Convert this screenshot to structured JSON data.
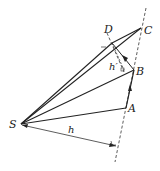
{
  "diagram": {
    "points": {
      "S": {
        "label": "S",
        "x": 21,
        "y": 124
      },
      "A": {
        "label": "A",
        "x": 126,
        "y": 108
      },
      "B": {
        "label": "B",
        "x": 134,
        "y": 70
      },
      "C": {
        "label": "C",
        "x": 141,
        "y": 28
      },
      "D": {
        "label": "D",
        "x": 107,
        "y": 30
      }
    },
    "distances": {
      "h": "h",
      "h_prime": "h′"
    },
    "colors": {
      "stroke": "#222222",
      "background": "#ffffff"
    }
  }
}
